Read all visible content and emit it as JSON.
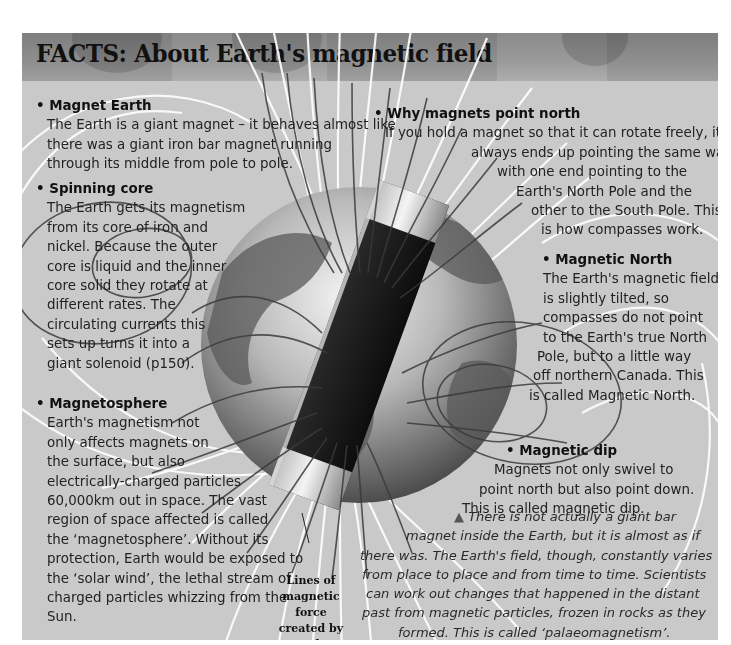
{
  "page": {
    "title": "FACTS: About Earth's magnetic field",
    "colors": {
      "panel_bg": "#c9c9c9",
      "header_bg": "#8f8f8f",
      "text": "#222222",
      "field_lines_light": "#ffffff",
      "field_lines_dark": "#3a3a3a"
    }
  },
  "left_column": {
    "sections": [
      {
        "heading": "Magnet Earth",
        "lines": [
          "The Earth is a giant magnet – it behaves almost like",
          "there was a giant iron bar magnet running",
          "through its middle from pole to pole."
        ]
      },
      {
        "heading": "Spinning core",
        "lines": [
          "The Earth gets its magnetism",
          "from its core of iron and",
          "nickel. Because the outer",
          "core is liquid and the inner",
          "core solid they rotate at",
          "different rates. The",
          "circulating currents this",
          "sets up turns it into a",
          "giant solenoid (p150)."
        ]
      },
      {
        "heading": "Magnetosphere",
        "lines": [
          "Earth's magnetism not",
          "only affects magnets on",
          "the surface, but also",
          "electrically-charged particles",
          "60,000km out in space. The vast",
          "region of space affected is called",
          "the ‘magnetosphere’. Without its",
          "protection, Earth would be exposed to",
          "the ‘solar wind’, the lethal stream of",
          "charged particles whizzing from the",
          "Sun."
        ]
      }
    ]
  },
  "right_column": {
    "sections": [
      {
        "heading": "Why magnets point north",
        "lines": [
          "If you hold a magnet so that it can rotate freely, it",
          "always ends up pointing the same way,",
          "with one end pointing to the",
          "Earth's North Pole and the",
          "other to the South Pole. This",
          "is how compasses work."
        ]
      },
      {
        "heading": "Magnetic North",
        "lines": [
          "The Earth's magnetic field",
          "is slightly tilted, so",
          "compasses do not point",
          "to the Earth's true North",
          "Pole, but to a little way",
          "off northern Canada. This",
          "is called Magnetic North."
        ]
      },
      {
        "heading": "Magnetic dip",
        "lines": [
          "Magnets not only swivel to",
          "point north but also point down.",
          "This is called magnetic dip."
        ]
      }
    ]
  },
  "illustration": {
    "label_lines": [
      "Lines of",
      "magnetic force",
      "created by",
      "Earth's",
      "magnetism"
    ],
    "icon": "globe-with-bar-magnet"
  },
  "note": {
    "marker": "▲",
    "lines": [
      "There is not actually a giant bar",
      "magnet inside the Earth, but it is almost as if",
      "there was. The Earth's field, though, constantly varies",
      "from place to place and from time to time. Scientists",
      "can work out changes that happened in the distant",
      "past from magnetic particles, frozen in rocks as they",
      "formed. This is called ‘palaeomagnetism’."
    ]
  }
}
